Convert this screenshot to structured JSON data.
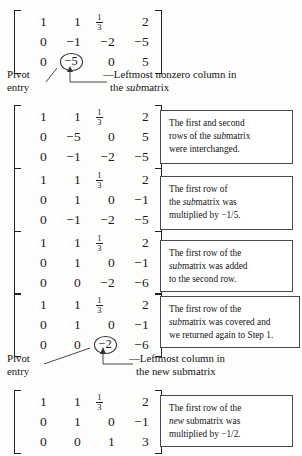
{
  "document": {
    "title": "Gaussian Elimination Worked Steps",
    "fraction_one_third": {
      "numerator": "1",
      "denominator": "3"
    }
  },
  "matrices": [
    {
      "id": "matrix-1",
      "rows": [
        [
          "1",
          "1",
          "1/3",
          "2"
        ],
        [
          "0",
          "−1",
          "−2",
          "−5"
        ],
        [
          "0",
          "−5",
          "0",
          "5"
        ]
      ],
      "circled": {
        "row": 2,
        "col": 1,
        "text": "−5"
      }
    },
    {
      "id": "matrix-2",
      "rows": [
        [
          "1",
          "1",
          "1/3",
          "2"
        ],
        [
          "0",
          "−5",
          "0",
          "5"
        ],
        [
          "0",
          "−1",
          "−2",
          "−5"
        ]
      ],
      "circled": null
    },
    {
      "id": "matrix-3",
      "rows": [
        [
          "1",
          "1",
          "1/3",
          "2"
        ],
        [
          "0",
          "1",
          "0",
          "−1"
        ],
        [
          "0",
          "−1",
          "−2",
          "−5"
        ]
      ],
      "circled": null
    },
    {
      "id": "matrix-4",
      "rows": [
        [
          "1",
          "1",
          "1/3",
          "2"
        ],
        [
          "0",
          "1",
          "0",
          "−1"
        ],
        [
          "0",
          "0",
          "−2",
          "−6"
        ]
      ],
      "circled": null
    },
    {
      "id": "matrix-5",
      "rows": [
        [
          "1",
          "1",
          "1/3",
          "2"
        ],
        [
          "0",
          "1",
          "0",
          "−1"
        ],
        [
          "0",
          "0",
          "−2",
          "−6"
        ]
      ],
      "circled": {
        "row": 2,
        "col": 2,
        "text": "−2"
      }
    },
    {
      "id": "matrix-6",
      "rows": [
        [
          "1",
          "1",
          "1/3",
          "2"
        ],
        [
          "0",
          "1",
          "0",
          "−1"
        ],
        [
          "0",
          "0",
          "1",
          "3"
        ]
      ],
      "circled": null
    }
  ],
  "notes": [
    {
      "id": "note-1",
      "lines": [
        "The first and second",
        "rows of the submatrix",
        "were interchanged."
      ],
      "italic_word": "sub"
    },
    {
      "id": "note-2",
      "lines": [
        "The first row of",
        "the submatrix was",
        "multiplied by −1/5."
      ],
      "italic_word": "sub"
    },
    {
      "id": "note-3",
      "lines": [
        "The first row of the",
        "submatrix was added",
        "to the second row."
      ],
      "italic_word": "sub"
    },
    {
      "id": "note-4",
      "lines": [
        "The first row of the",
        "submatrix was covered and",
        "we returned again to Step 1."
      ],
      "italic_word": "sub"
    },
    {
      "id": "note-5",
      "lines": [
        "The first row of the",
        "new submatrix was",
        "multiplied by −1/2."
      ],
      "italic_word": "new"
    }
  ],
  "callouts": [
    {
      "id": "callout-1",
      "pivot_label_line1": "Pivot",
      "pivot_label_line2": "entry",
      "description_line1": "Leftmost nonzero column in",
      "description_line2": "the submatrix",
      "description_line2_italic": "sub",
      "description_line2_rest": "matrix",
      "dash_prefix": "—"
    },
    {
      "id": "callout-2",
      "pivot_label_line1": "Pivot",
      "pivot_label_line2": "entry",
      "description_line1": "Leftmost column in",
      "description_line2": "the new submatrix",
      "dash_prefix": "—"
    }
  ],
  "colors": {
    "ink": "#1a1a1a",
    "box_border": "#4a4a4a",
    "paper": "#fdfdfb"
  }
}
